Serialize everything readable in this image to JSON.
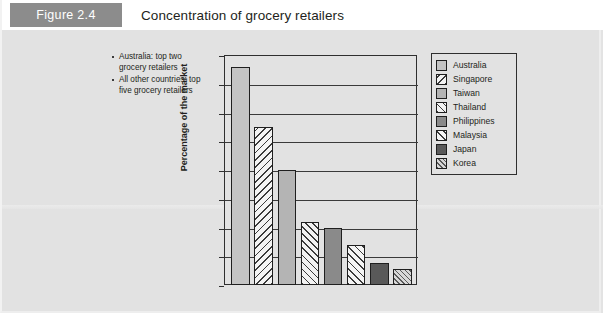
{
  "figure": {
    "tag": "Figure 2.4",
    "title": "Concentration of grocery retailers"
  },
  "notes": [
    "Australia: top two grocery retailers",
    "All other countries: top five grocery retailers"
  ],
  "colors": {
    "tag_background": "#8c8c8c",
    "panel_background": "#e2e2e2",
    "axis": "#2f2f2f",
    "title_bar": "#ffffff"
  },
  "chart_data": {
    "type": "bar",
    "title": "Concentration of grocery retailers",
    "xlabel": "",
    "ylabel": "Percentage of the market",
    "ylim": [
      0,
      80
    ],
    "yticks": [
      0,
      10,
      20,
      30,
      40,
      50,
      60,
      70,
      80
    ],
    "grid": true,
    "legend_position": "right",
    "categories": [
      "Australia",
      "Singapore",
      "Taiwan",
      "Thailand",
      "Philippines",
      "Malaysia",
      "Japan",
      "Korea"
    ],
    "values": [
      76,
      55,
      40,
      22,
      20,
      14,
      7.5,
      5.5
    ],
    "patterns": [
      "solid-light",
      "backslash",
      "solid-mid",
      "crosshatch",
      "solid-dark",
      "forwardslash",
      "solid-darker",
      "finehatch"
    ]
  },
  "legend": {
    "items": [
      {
        "label": "Australia"
      },
      {
        "label": "Singapore"
      },
      {
        "label": "Taiwan"
      },
      {
        "label": "Thailand"
      },
      {
        "label": "Philippines"
      },
      {
        "label": "Malaysia"
      },
      {
        "label": "Japan"
      },
      {
        "label": "Korea"
      }
    ]
  }
}
